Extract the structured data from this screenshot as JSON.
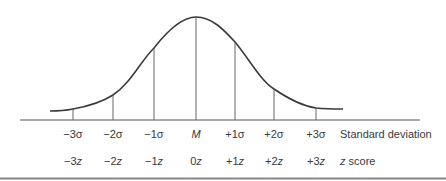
{
  "diagram": {
    "type": "normal-distribution-curve",
    "stroke_color": "#3a3a3a",
    "markers": [
      {
        "sd": "−3σ",
        "z": "−3z",
        "x": 73
      },
      {
        "sd": "−2σ",
        "z": "−2z",
        "x": 113
      },
      {
        "sd": "−1σ",
        "z": "−1z",
        "x": 154
      },
      {
        "sd": "M",
        "z": "0z",
        "x": 196
      },
      {
        "sd": "+1σ",
        "z": "+1z",
        "x": 235
      },
      {
        "sd": "+2σ",
        "z": "+2z",
        "x": 274
      },
      {
        "sd": "+3σ",
        "z": "+3z",
        "x": 316
      }
    ],
    "row_labels": {
      "standard_deviation": "Standard deviation",
      "z_score_prefix": "z",
      "z_score_suffix": " score"
    }
  }
}
